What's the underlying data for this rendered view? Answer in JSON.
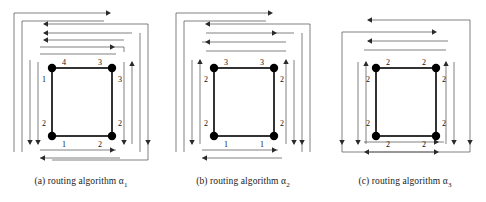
{
  "figure": {
    "panel_count": 3,
    "background_color": "#ffffff",
    "node_color": "#000000",
    "square_edge_color": "#000000",
    "route_line_color": "#4a4a4a"
  },
  "panels": [
    {
      "id": "a",
      "caption_prefix": "(a)",
      "caption_text": "routing algorithm",
      "caption_symbol": "α",
      "caption_subscript": "1",
      "caption_full": "(a) routing algorithm α₁",
      "edge_labels": {
        "top_left": "4",
        "top_right": "3",
        "left_top": "1",
        "left_bottom": "2",
        "right_top": "3",
        "right_bottom": "2",
        "bottom_left": "1",
        "bottom_right": "2"
      },
      "top_routes": [
        {
          "direction": "right"
        },
        {
          "direction": "left"
        },
        {
          "direction": "left"
        },
        {
          "direction": "left"
        },
        {
          "direction": "right"
        }
      ],
      "bottom_routes": [
        {
          "direction": "right"
        },
        {
          "direction": "left"
        }
      ],
      "left_routes": [
        {
          "direction": "down"
        },
        {
          "direction": "down"
        }
      ],
      "right_routes": [
        {
          "direction": "down"
        },
        {
          "direction": "down"
        },
        {
          "direction": "up"
        }
      ]
    },
    {
      "id": "b",
      "caption_prefix": "(b)",
      "caption_text": "routing algorithm",
      "caption_symbol": "α",
      "caption_subscript": "2",
      "caption_full": "(b) routing algorithm α₂",
      "edge_labels": {
        "top_left": "3",
        "top_right": "3",
        "left_top": "2",
        "left_bottom": "2",
        "right_top": "2",
        "right_bottom": "2",
        "bottom_left": "1",
        "bottom_right": "1"
      },
      "top_routes": [
        {
          "direction": "right"
        },
        {
          "direction": "left"
        },
        {
          "direction": "right"
        },
        {
          "direction": "left"
        }
      ],
      "bottom_routes": [
        {
          "direction": "right"
        },
        {
          "direction": "left"
        }
      ],
      "left_routes": [
        {
          "direction": "down"
        },
        {
          "direction": "up"
        }
      ],
      "right_routes": [
        {
          "direction": "up"
        },
        {
          "direction": "down"
        },
        {
          "direction": "down"
        }
      ]
    },
    {
      "id": "c",
      "caption_prefix": "(c)",
      "caption_text": "routing algorithm",
      "caption_symbol": "α",
      "caption_subscript": "3",
      "caption_full": "(c) routing algorithm α₃",
      "edge_labels": {
        "top_left": "2",
        "top_right": "2",
        "left_top": "2",
        "left_bottom": "2",
        "right_top": "2",
        "right_bottom": "2",
        "bottom_left": "2",
        "bottom_right": "2"
      },
      "top_routes": [
        {
          "direction": "left"
        },
        {
          "direction": "right"
        },
        {
          "direction": "left"
        }
      ],
      "bottom_routes": [
        {
          "direction": "right"
        },
        {
          "direction": "left"
        },
        {
          "direction": "right"
        }
      ],
      "left_routes": [
        {
          "direction": "down"
        },
        {
          "direction": "down"
        }
      ],
      "right_routes": [
        {
          "direction": "up"
        },
        {
          "direction": "down"
        },
        {
          "direction": "down"
        }
      ]
    }
  ]
}
